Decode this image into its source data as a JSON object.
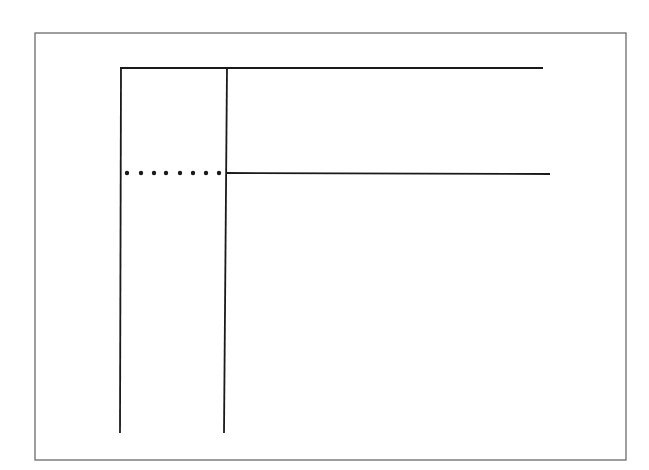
{
  "canvas": {
    "width": 649,
    "height": 470,
    "background": "#ffffff"
  },
  "diagram": {
    "frame": {
      "x": 35,
      "y": 33,
      "width": 591,
      "height": 427,
      "stroke": "#6b6b6b",
      "stroke_width": 1.3
    },
    "line_color": "#1a1a1a",
    "lines": [
      {
        "name": "top-horizontal-line",
        "x1": 120,
        "y1": 68,
        "x2": 543,
        "y2": 68,
        "width": 1.8
      },
      {
        "name": "left-vertical-line",
        "x1": 121,
        "y1": 68,
        "x2": 120,
        "y2": 433,
        "width": 1.8
      },
      {
        "name": "inner-vertical-line",
        "x1": 227,
        "y1": 68,
        "x2": 224,
        "y2": 433,
        "width": 1.8
      },
      {
        "name": "middle-horizontal-line",
        "x1": 226,
        "y1": 173,
        "x2": 550,
        "y2": 174,
        "width": 1.8
      }
    ],
    "dotted_line": {
      "name": "dotted-connector",
      "y": 173,
      "dots_x": [
        127,
        141,
        154,
        166,
        180,
        193,
        206,
        219
      ],
      "radius": 2.2
    }
  }
}
